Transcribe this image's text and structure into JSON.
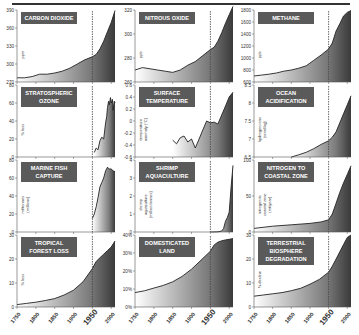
{
  "chart_data": [
    {
      "type": "area",
      "title": "CARBON DIOXIDE",
      "ylabel": "ppm",
      "ylim": [
        270,
        390
      ],
      "yticks": [
        270,
        300,
        330,
        360,
        390
      ],
      "x": [
        1750,
        1770,
        1790,
        1810,
        1830,
        1850,
        1870,
        1890,
        1910,
        1930,
        1950,
        1960,
        1970,
        1980,
        1990,
        2000,
        2010
      ],
      "values": [
        277,
        277,
        279,
        283,
        283,
        285,
        288,
        293,
        300,
        307,
        312,
        316,
        325,
        338,
        354,
        369,
        389
      ]
    },
    {
      "type": "area",
      "title": "NITROUS OXIDE",
      "ylabel": "ppb",
      "ylim": [
        260,
        320
      ],
      "yticks": [
        260,
        280,
        300,
        320
      ],
      "x": [
        1750,
        1770,
        1790,
        1810,
        1830,
        1850,
        1870,
        1890,
        1910,
        1930,
        1950,
        1960,
        1970,
        1980,
        1990,
        2000,
        2010
      ],
      "values": [
        270,
        272,
        271,
        270,
        269,
        268,
        270,
        274,
        277,
        282,
        287,
        289,
        294,
        301,
        309,
        316,
        323
      ]
    },
    {
      "type": "area",
      "title": "METHANE",
      "ylabel": "ppb",
      "ylim": [
        600,
        1800
      ],
      "yticks": [
        600,
        800,
        1000,
        1200,
        1400,
        1600,
        1800
      ],
      "x": [
        1750,
        1770,
        1790,
        1810,
        1830,
        1850,
        1870,
        1890,
        1910,
        1930,
        1950,
        1960,
        1970,
        1980,
        1990,
        2000,
        2010
      ],
      "values": [
        700,
        715,
        730,
        750,
        780,
        800,
        830,
        870,
        960,
        1050,
        1150,
        1250,
        1450,
        1570,
        1700,
        1760,
        1790
      ]
    },
    {
      "type": "area",
      "title": "STRATOSPHERIC OZONE",
      "ylabel": "% loss",
      "ylim": [
        0,
        80
      ],
      "yticks": [
        0,
        20,
        40,
        60,
        80
      ],
      "x": [
        1955,
        1960,
        1965,
        1970,
        1975,
        1980,
        1985,
        1988,
        1990,
        1993,
        1995,
        1998,
        2000,
        2003,
        2005,
        2008,
        2010
      ],
      "values": [
        5,
        10,
        8,
        18,
        22,
        20,
        38,
        45,
        55,
        62,
        58,
        66,
        60,
        64,
        52,
        62,
        60
      ]
    },
    {
      "type": "area",
      "title": "SURFACE TEMPERATURE",
      "ylabel": "temperature anomaly (°C)",
      "ylim": [
        -0.6,
        0.6
      ],
      "yticks": [
        -0.6,
        -0.4,
        -0.2,
        0,
        0.2,
        0.4,
        0.6
      ],
      "x": [
        1850,
        1860,
        1870,
        1880,
        1890,
        1900,
        1910,
        1920,
        1930,
        1940,
        1950,
        1960,
        1970,
        1980,
        1990,
        2000,
        2010
      ],
      "values": [
        -0.32,
        -0.38,
        -0.28,
        -0.25,
        -0.35,
        -0.3,
        -0.45,
        -0.3,
        -0.15,
        0.0,
        -0.03,
        -0.02,
        -0.05,
        0.1,
        0.25,
        0.4,
        0.48
      ]
    },
    {
      "type": "area",
      "title": "OCEAN ACIDIFICATION",
      "ylabel": "hydrogen ions (nmol/kg)",
      "ylim": [
        6.5,
        8.5
      ],
      "yticks": [
        6.5,
        7,
        7.5,
        8,
        8.5
      ],
      "x": [
        1850,
        1870,
        1890,
        1910,
        1930,
        1950,
        1960,
        1970,
        1980,
        1990,
        2000,
        2010
      ],
      "values": [
        6.5,
        6.56,
        6.63,
        6.73,
        6.85,
        6.95,
        7.05,
        7.2,
        7.45,
        7.7,
        7.95,
        8.2
      ]
    },
    {
      "type": "area",
      "title": "MARINE FISH CAPTURE",
      "ylabel": "mt/tonnes (millions)",
      "ylim": [
        0,
        80
      ],
      "yticks": [
        0,
        20,
        40,
        60,
        80
      ],
      "x": [
        1950,
        1955,
        1960,
        1965,
        1970,
        1975,
        1980,
        1985,
        1990,
        1995,
        2000,
        2005,
        2010
      ],
      "values": [
        15,
        20,
        28,
        38,
        50,
        55,
        60,
        68,
        72,
        70,
        70,
        68,
        67
      ]
    },
    {
      "type": "area",
      "title": "SHRIMP AQUACULTURE",
      "ylabel": "shrimp aquaculture (million tonnes)",
      "ylim": [
        0,
        4
      ],
      "yticks": [
        0,
        1,
        2,
        3,
        4
      ],
      "x": [
        1950,
        1970,
        1980,
        1985,
        1990,
        1995,
        2000,
        2005,
        2010
      ],
      "values": [
        0,
        0.01,
        0.05,
        0.2,
        0.6,
        0.8,
        1.1,
        2.5,
        3.7
      ]
    },
    {
      "type": "area",
      "title": "NITROGEN TO COASTAL ZONE",
      "ylabel": "nitrogen to coastal zone (mt/year)",
      "ylim": [
        0,
        100
      ],
      "yticks": [
        0,
        50,
        100
      ],
      "x": [
        1750,
        1800,
        1850,
        1900,
        1930,
        1950,
        1960,
        1970,
        1980,
        1990,
        2000,
        2010
      ],
      "values": [
        5,
        8,
        10,
        12,
        14,
        17,
        25,
        40,
        55,
        68,
        80,
        92
      ]
    },
    {
      "type": "area",
      "title": "TROPICAL FOREST LOSS",
      "ylabel": "% loss",
      "ylim": [
        0,
        30
      ],
      "yticks": [
        0,
        10,
        20,
        30
      ],
      "x": [
        1750,
        1775,
        1800,
        1825,
        1850,
        1875,
        1900,
        1925,
        1950,
        1960,
        1970,
        1980,
        1990,
        2000,
        2010
      ],
      "values": [
        1,
        1.5,
        2,
        2.7,
        3.5,
        5,
        7,
        10.5,
        16,
        19,
        20.5,
        22,
        23.5,
        25,
        27.5
      ]
    },
    {
      "type": "area",
      "title": "DOMESTICATED LAND",
      "ylabel": "",
      "ylim": [
        0,
        40
      ],
      "yticks": [
        "0%",
        "10%",
        "20%",
        "30%",
        "40%"
      ],
      "x": [
        1750,
        1775,
        1800,
        1825,
        1850,
        1875,
        1900,
        1925,
        1950,
        1960,
        1970,
        1980,
        1990,
        2000,
        2010
      ],
      "values": [
        8,
        9,
        10.5,
        12,
        14,
        17,
        21,
        26,
        31,
        34.5,
        36,
        36.8,
        37.3,
        37.6,
        38
      ]
    },
    {
      "type": "area",
      "title": "TERRESTRIAL BIOSPHERE DEGRADATION",
      "ylabel": "% decline",
      "ylim": [
        0,
        30
      ],
      "yticks": [
        0,
        10,
        20,
        30
      ],
      "x": [
        1750,
        1775,
        1800,
        1825,
        1850,
        1875,
        1900,
        1925,
        1950,
        1960,
        1970,
        1980,
        1990,
        2000,
        2010
      ],
      "values": [
        4.5,
        5,
        5.5,
        6,
        6.8,
        7.8,
        9.5,
        11.5,
        14.5,
        17,
        20,
        23,
        26,
        29,
        30
      ]
    }
  ],
  "panels": [
    {
      "title_lines": [
        "CARBON DIOXIDE"
      ],
      "ylabel_lines": [
        "ppm"
      ]
    },
    {
      "title_lines": [
        "NITROUS OXIDE"
      ],
      "ylabel_lines": [
        "ppb"
      ]
    },
    {
      "title_lines": [
        "METHANE"
      ],
      "ylabel_lines": [
        "ppb"
      ]
    },
    {
      "title_lines": [
        "STRATOSPHERIC",
        "OZONE"
      ],
      "ylabel_lines": [
        "% loss"
      ]
    },
    {
      "title_lines": [
        "SURFACE",
        "TEMPERATURE"
      ],
      "ylabel_lines": [
        "temperature",
        "anomaly (°C)"
      ]
    },
    {
      "title_lines": [
        "OCEAN",
        "ACIDIFICATION"
      ],
      "ylabel_lines": [
        "hydrogen ions",
        "(nmol/kg)"
      ]
    },
    {
      "title_lines": [
        "MARINE FISH",
        "CAPTURE"
      ],
      "ylabel_lines": [
        "mt/tonnes",
        "(millions)"
      ]
    },
    {
      "title_lines": [
        "SHRIMP",
        "AQUACULTURE"
      ],
      "ylabel_lines": [
        "shrimp",
        "aquaculture",
        "(million tonnes)"
      ]
    },
    {
      "title_lines": [
        "NITROGEN TO",
        "COASTAL ZONE"
      ],
      "ylabel_lines": [
        "nitrogen to",
        "coastal zone",
        "(mt/year)"
      ]
    },
    {
      "title_lines": [
        "TROPICAL",
        "FOREST LOSS"
      ],
      "ylabel_lines": [
        "% loss"
      ]
    },
    {
      "title_lines": [
        "DOMESTICATED",
        "LAND"
      ],
      "ylabel_lines": []
    },
    {
      "title_lines": [
        "TERRESTRIAL",
        "BIOSPHERE",
        "DEGRADATION"
      ],
      "ylabel_lines": [
        "% decline"
      ]
    }
  ],
  "xaxis": {
    "range": [
      1750,
      2010
    ],
    "ticks": [
      "1750",
      "1800",
      "1850",
      "1900",
      "1950",
      "2000"
    ],
    "marker_year": 1950
  },
  "colors": {
    "title_box": "#5a5a5a",
    "title_text": "#ffffff",
    "line": "#222222",
    "fill_light": "#ffffff",
    "fill_dark": "#3a3a3a",
    "marker": "#444444"
  }
}
